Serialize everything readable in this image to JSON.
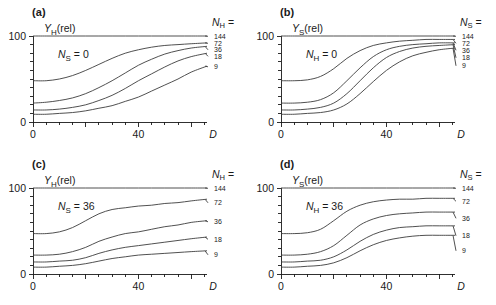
{
  "figure": {
    "panel_count": 4,
    "axis_color": "#1a1a1a",
    "curve_color": "#3c3c3c",
    "background": "#ffffff"
  },
  "panels": [
    {
      "tag": "(a)",
      "ylabel_main": "Y",
      "ylabel_sub": "H",
      "ylabel_tail": "(rel)",
      "condition_main": "N",
      "condition_sub": "S",
      "condition_tail": " = 0",
      "legend_main": "N",
      "legend_sub": "H",
      "legend_tail": " =",
      "xlabel": "D",
      "yticks": [
        "100",
        "0"
      ],
      "xticks": [
        "0",
        "40"
      ],
      "series_labels": [
        "144",
        "72",
        "36",
        "18",
        "9"
      ]
    },
    {
      "tag": "(b)",
      "ylabel_main": "Y",
      "ylabel_sub": "S",
      "ylabel_tail": "(rel)",
      "condition_main": "N",
      "condition_sub": "H",
      "condition_tail": " = 0",
      "legend_main": "N",
      "legend_sub": "S",
      "legend_tail": " =",
      "xlabel": "D",
      "yticks": [
        "100",
        "0"
      ],
      "xticks": [
        "0",
        "40"
      ],
      "series_labels": [
        "144",
        "72",
        "36",
        "18",
        "9"
      ]
    },
    {
      "tag": "(c)",
      "ylabel_main": "Y",
      "ylabel_sub": "H",
      "ylabel_tail": "(rel)",
      "condition_main": "N",
      "condition_sub": "S",
      "condition_tail": " = 36",
      "legend_main": "N",
      "legend_sub": "H",
      "legend_tail": " =",
      "xlabel": "D",
      "yticks": [
        "100",
        "0"
      ],
      "xticks": [
        "0",
        "40"
      ],
      "series_labels": [
        "144",
        "72",
        "36",
        "18",
        "9"
      ]
    },
    {
      "tag": "(d)",
      "ylabel_main": "Y",
      "ylabel_sub": "S",
      "ylabel_tail": "(rel)",
      "condition_main": "N",
      "condition_sub": "H",
      "condition_tail": " = 36",
      "legend_main": "N",
      "legend_sub": "S",
      "legend_tail": " =",
      "xlabel": "D",
      "yticks": [
        "100",
        "0"
      ],
      "xticks": [
        "0",
        "40"
      ],
      "series_labels": [
        "144",
        "72",
        "36",
        "18",
        "9"
      ]
    }
  ],
  "chart_data": [
    {
      "type": "line",
      "title": "(a)",
      "xlabel": "D",
      "ylabel": "Y_H(rel)",
      "annotation": "N_S = 0",
      "legend_title": "N_H =",
      "legend_position": "right",
      "grid": false,
      "xlim": [
        0,
        66
      ],
      "ylim": [
        0,
        105
      ],
      "xticks": [
        0,
        40
      ],
      "yticks": [
        0,
        100
      ],
      "x": [
        0,
        5,
        10,
        15,
        20,
        25,
        30,
        35,
        40,
        45,
        50,
        55,
        60,
        66
      ],
      "series": [
        {
          "name": "144",
          "values": [
            100,
            100,
            100,
            100,
            100,
            100,
            100,
            100,
            100,
            100,
            100,
            100,
            100,
            100
          ]
        },
        {
          "name": "72",
          "values": [
            48,
            48,
            50,
            54,
            60,
            67,
            74,
            80,
            84,
            87,
            89,
            90,
            91,
            92
          ]
        },
        {
          "name": "36",
          "values": [
            22,
            23,
            25,
            28,
            33,
            40,
            48,
            57,
            66,
            73,
            79,
            83,
            86,
            88
          ]
        },
        {
          "name": "18",
          "values": [
            14,
            14,
            15,
            17,
            20,
            25,
            31,
            39,
            48,
            56,
            64,
            71,
            76,
            80
          ]
        },
        {
          "name": "9",
          "values": [
            9,
            9,
            10,
            11,
            13,
            16,
            19,
            24,
            29,
            36,
            43,
            50,
            58,
            65
          ]
        }
      ]
    },
    {
      "type": "line",
      "title": "(b)",
      "xlabel": "D",
      "ylabel": "Y_S(rel)",
      "annotation": "N_H = 0",
      "legend_title": "N_S =",
      "legend_position": "right",
      "grid": false,
      "xlim": [
        0,
        66
      ],
      "ylim": [
        0,
        105
      ],
      "xticks": [
        0,
        40
      ],
      "yticks": [
        0,
        100
      ],
      "x": [
        0,
        5,
        10,
        15,
        20,
        25,
        30,
        35,
        40,
        45,
        50,
        55,
        60,
        66
      ],
      "series": [
        {
          "name": "144",
          "values": [
            100,
            100,
            100,
            100,
            100,
            100,
            100,
            100,
            100,
            100,
            100,
            100,
            100,
            100
          ]
        },
        {
          "name": "72",
          "values": [
            48,
            48,
            49,
            53,
            62,
            74,
            83,
            89,
            92,
            94,
            95,
            96,
            96,
            96
          ]
        },
        {
          "name": "36",
          "values": [
            22,
            22,
            23,
            26,
            34,
            48,
            63,
            76,
            84,
            88,
            90,
            91,
            92,
            92
          ]
        },
        {
          "name": "18",
          "values": [
            14,
            14,
            15,
            17,
            22,
            33,
            48,
            63,
            75,
            82,
            86,
            88,
            89,
            90
          ]
        },
        {
          "name": "9",
          "values": [
            9,
            9,
            10,
            11,
            14,
            21,
            33,
            47,
            60,
            70,
            77,
            81,
            84,
            86
          ]
        }
      ]
    },
    {
      "type": "line",
      "title": "(c)",
      "xlabel": "D",
      "ylabel": "Y_H(rel)",
      "annotation": "N_S = 36",
      "legend_title": "N_H =",
      "legend_position": "right",
      "grid": false,
      "xlim": [
        0,
        66
      ],
      "ylim": [
        0,
        105
      ],
      "xticks": [
        0,
        40
      ],
      "yticks": [
        0,
        100
      ],
      "x": [
        0,
        5,
        10,
        15,
        20,
        25,
        30,
        35,
        40,
        45,
        50,
        55,
        60,
        66
      ],
      "series": [
        {
          "name": "144",
          "values": [
            100,
            100,
            100,
            100,
            100,
            100,
            100,
            100,
            100,
            100,
            100,
            100,
            100,
            100
          ]
        },
        {
          "name": "72",
          "values": [
            47,
            47,
            49,
            54,
            62,
            70,
            75,
            77,
            79,
            80,
            82,
            83,
            85,
            87
          ]
        },
        {
          "name": "36",
          "values": [
            22,
            22,
            23,
            26,
            31,
            38,
            43,
            47,
            49,
            52,
            55,
            57,
            60,
            62
          ]
        },
        {
          "name": "18",
          "values": [
            14,
            14,
            15,
            16,
            19,
            24,
            28,
            31,
            33,
            35,
            37,
            39,
            41,
            43
          ]
        },
        {
          "name": "9",
          "values": [
            8,
            8,
            9,
            10,
            12,
            15,
            18,
            20,
            22,
            23,
            24,
            25,
            26,
            27
          ]
        }
      ]
    },
    {
      "type": "line",
      "title": "(d)",
      "xlabel": "D",
      "ylabel": "Y_S(rel)",
      "annotation": "N_H = 36",
      "legend_title": "N_S =",
      "legend_position": "right",
      "grid": false,
      "xlim": [
        0,
        66
      ],
      "ylim": [
        0,
        105
      ],
      "xticks": [
        0,
        40
      ],
      "yticks": [
        0,
        100
      ],
      "x": [
        0,
        5,
        10,
        15,
        20,
        25,
        30,
        35,
        40,
        45,
        50,
        55,
        60,
        66
      ],
      "series": [
        {
          "name": "144",
          "values": [
            100,
            100,
            100,
            100,
            100,
            100,
            100,
            100,
            100,
            100,
            100,
            100,
            100,
            100
          ]
        },
        {
          "name": "72",
          "values": [
            47,
            47,
            48,
            52,
            62,
            73,
            80,
            84,
            86,
            87,
            87,
            88,
            88,
            88
          ]
        },
        {
          "name": "36",
          "values": [
            22,
            22,
            23,
            26,
            33,
            45,
            57,
            64,
            68,
            70,
            71,
            72,
            72,
            72
          ]
        },
        {
          "name": "18",
          "values": [
            14,
            14,
            15,
            16,
            20,
            28,
            38,
            46,
            51,
            54,
            55,
            56,
            56,
            56
          ]
        },
        {
          "name": "9",
          "values": [
            8,
            8,
            9,
            10,
            13,
            19,
            27,
            34,
            39,
            42,
            44,
            45,
            45,
            45
          ]
        }
      ]
    }
  ]
}
